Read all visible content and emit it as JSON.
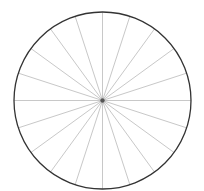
{
  "diagram": {
    "type": "circle-with-radial-spokes",
    "center": [
      102.5,
      100.5
    ],
    "radius": 88.5,
    "spoke_count": 20,
    "spoke_angle_step_deg": 18,
    "colors": {
      "background": "#ffffff",
      "circle_stroke": "#333333",
      "spoke_stroke": "#c8c8c8",
      "center_dot": "#555555"
    }
  }
}
